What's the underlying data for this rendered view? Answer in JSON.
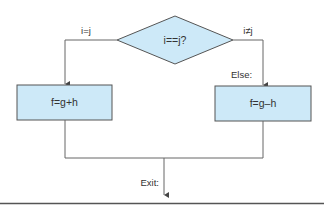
{
  "diagram": {
    "type": "flowchart",
    "decision": {
      "label": "i==j?"
    },
    "branches": {
      "true_label": "i=j",
      "false_label": "i≠j"
    },
    "blocks": {
      "then_block": "f=g+h",
      "else_block": "f=g–h"
    },
    "labels": {
      "else_label": "Else:",
      "exit_label": "Exit:"
    },
    "colors": {
      "fill": "#cde9f8",
      "stroke": "#555555",
      "text": "#333333"
    }
  }
}
